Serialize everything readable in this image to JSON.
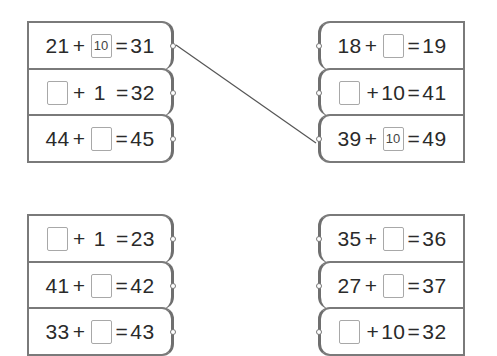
{
  "groups": {
    "top_left": {
      "rows": [
        {
          "a": "21",
          "op": "+",
          "b": "10",
          "eq": "=",
          "result": "31",
          "blank": "b",
          "filled": true
        },
        {
          "a": "",
          "op": "+",
          "b": "1",
          "eq": "=",
          "result": "32",
          "blank": "a",
          "filled": false
        },
        {
          "a": "44",
          "op": "+",
          "b": "",
          "eq": "=",
          "result": "45",
          "blank": "b",
          "filled": false
        }
      ]
    },
    "top_right": {
      "rows": [
        {
          "a": "18",
          "op": "+",
          "b": "",
          "eq": "=",
          "result": "19",
          "blank": "b",
          "filled": false
        },
        {
          "a": "",
          "op": "+",
          "b": "10",
          "eq": "=",
          "result": "41",
          "blank": "a",
          "filled": false
        },
        {
          "a": "39",
          "op": "+",
          "b": "10",
          "eq": "=",
          "result": "49",
          "blank": "b",
          "filled": true
        }
      ]
    },
    "bottom_left": {
      "rows": [
        {
          "a": "",
          "op": "+",
          "b": "1",
          "eq": "=",
          "result": "23",
          "blank": "a",
          "filled": false
        },
        {
          "a": "41",
          "op": "+",
          "b": "",
          "eq": "=",
          "result": "42",
          "blank": "b",
          "filled": false
        },
        {
          "a": "33",
          "op": "+",
          "b": "",
          "eq": "=",
          "result": "43",
          "blank": "b",
          "filled": false
        }
      ]
    },
    "bottom_right": {
      "rows": [
        {
          "a": "35",
          "op": "+",
          "b": "",
          "eq": "=",
          "result": "36",
          "blank": "b",
          "filled": false
        },
        {
          "a": "27",
          "op": "+",
          "b": "",
          "eq": "=",
          "result": "37",
          "blank": "b",
          "filled": false
        },
        {
          "a": "",
          "op": "+",
          "b": "10",
          "eq": "=",
          "result": "32",
          "blank": "a",
          "filled": false
        }
      ]
    }
  },
  "connections": [
    {
      "from": "top_left.0",
      "to": "top_right.2"
    }
  ],
  "colors": {
    "border": "#7a7a7a",
    "box_border": "#a8a8a8",
    "text": "#2a2a2a",
    "line": "#555555"
  }
}
